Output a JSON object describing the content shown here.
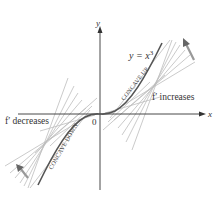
{
  "diagram": {
    "type": "function-graph",
    "function_label": "y = x",
    "function_exponent": "3",
    "axes": {
      "x_label": "x",
      "y_label": "y",
      "origin_label": "0"
    },
    "annotations": {
      "right": "f′ increases",
      "left": "f′ decreases",
      "concave_up": "CONCAVE UP",
      "concave_down": "CONCAVE DOWN"
    },
    "colors": {
      "curve": "#555555",
      "tangents": "#b8b8b8",
      "axes": "#333333",
      "arrow": "#666666"
    }
  }
}
